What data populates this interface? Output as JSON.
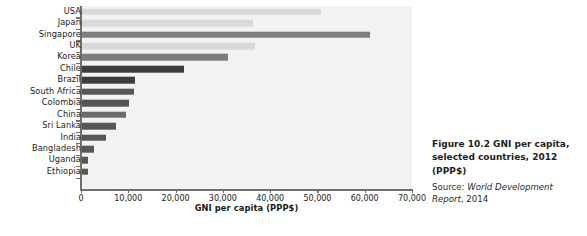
{
  "chart_data": {
    "type": "bar",
    "orientation": "horizontal",
    "title": "",
    "xlabel": "GNI per capita (PPP$)",
    "ylabel": "",
    "xlim": [
      0,
      70000
    ],
    "grid": false,
    "legend": "none",
    "tick_labels": [
      "0",
      "10,000",
      "20,000",
      "30,000",
      "40,000",
      "50,000",
      "60,000",
      "70,000"
    ],
    "ticks": [
      0,
      10000,
      20000,
      30000,
      40000,
      50000,
      60000,
      70000
    ],
    "categories": [
      "USA",
      "Japan",
      "Singapore",
      "UK",
      "Korea",
      "Chile",
      "Brazil",
      "South Africa",
      "Colombia",
      "China",
      "Sri Lanka",
      "India",
      "Bangladesh",
      "Uganda",
      "Ethiopia"
    ],
    "values": [
      50600,
      36300,
      61000,
      36600,
      30900,
      21600,
      11300,
      11100,
      10000,
      9500,
      7300,
      5200,
      2600,
      1400,
      1300
    ],
    "bar_colors": [
      "#d9d9d9",
      "#d9d9d9",
      "#7d7d7d",
      "#d9d9d9",
      "#7d7d7d",
      "#3d3d3d",
      "#3d3d3d",
      "#565656",
      "#565656",
      "#6b6b6b",
      "#565656",
      "#565656",
      "#565656",
      "#565656",
      "#565656"
    ],
    "plot_background": "#f2f2f2",
    "axis_color": "#6e6e6e"
  },
  "caption": {
    "title": "Figure 10.2 GNI per capita, selected countries, 2012 (PPP$)",
    "source_prefix": "Source: ",
    "source_italic": "World Development Report",
    "source_suffix": ", 2014"
  }
}
